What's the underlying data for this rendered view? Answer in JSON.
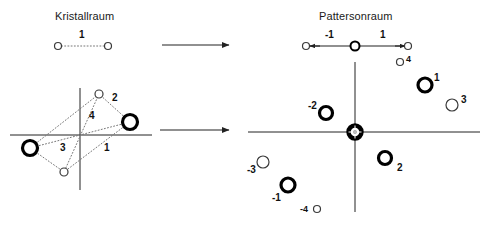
{
  "figure": {
    "background": "#ffffff",
    "stroke": "#222222",
    "dotted_stroke": "#777777"
  },
  "panels": {
    "left": {
      "title": "Kristallraum",
      "title_pos": {
        "x": 55,
        "y": 10
      },
      "dimer": {
        "atoms": [
          {
            "name": "atom-left",
            "cx": 58,
            "cy": 46,
            "r": 3.5,
            "weight": "light"
          },
          {
            "name": "atom-right",
            "cx": 108,
            "cy": 46,
            "r": 3.5,
            "weight": "light"
          }
        ],
        "vector_label": "1",
        "vector_label_pos": {
          "x": 79,
          "y": 29
        }
      },
      "structure": {
        "axes": {
          "x": {
            "x1": 10,
            "y1": 135,
            "x2": 152,
            "y2": 135
          },
          "y": {
            "x1": 80,
            "y1": 88,
            "x2": 80,
            "y2": 190
          }
        },
        "atoms": [
          {
            "name": "heavy-atom-left",
            "cx": 30,
            "cy": 148,
            "r": 7.5,
            "weight": "heavy"
          },
          {
            "name": "heavy-atom-right",
            "cx": 130,
            "cy": 122,
            "r": 7.5,
            "weight": "heavy"
          },
          {
            "name": "light-atom-top",
            "cx": 99,
            "cy": 94,
            "r": 4.0,
            "weight": "light"
          },
          {
            "name": "light-atom-bottom",
            "cx": 64,
            "cy": 172,
            "r": 4.0,
            "weight": "light"
          }
        ],
        "vector_labels": [
          {
            "text": "2",
            "x": 112,
            "y": 92
          },
          {
            "text": "4",
            "x": 89,
            "y": 110
          },
          {
            "text": "3",
            "x": 60,
            "y": 142
          },
          {
            "text": "1",
            "x": 104,
            "y": 142
          }
        ]
      }
    },
    "arrows": [
      {
        "name": "arrow-top",
        "x1": 162,
        "y1": 45,
        "x2": 229,
        "y2": 45
      },
      {
        "name": "arrow-bottom",
        "x1": 160,
        "y1": 130,
        "x2": 229,
        "y2": 130
      }
    ],
    "right": {
      "title": "Pattersonraum",
      "title_pos": {
        "x": 319,
        "y": 10
      },
      "patterson_1d": {
        "axis": {
          "x1": 306,
          "y1": 46,
          "x2": 409,
          "y2": 46
        },
        "peaks": [
          {
            "name": "peak-minus-1",
            "cx": 306,
            "cy": 46,
            "r": 3.5,
            "weight": "light"
          },
          {
            "name": "peak-origin",
            "cx": 355,
            "cy": 46,
            "r": 4.5,
            "weight": "medium"
          },
          {
            "name": "peak-plus-1",
            "cx": 408,
            "cy": 46,
            "r": 3.5,
            "weight": "light"
          }
        ],
        "labels": [
          {
            "text": "-1",
            "x": 325,
            "y": 29
          },
          {
            "text": "1",
            "x": 380,
            "y": 29
          }
        ]
      },
      "patterson_2d": {
        "axes": {
          "x": {
            "x1": 248,
            "y1": 132,
            "x2": 480,
            "y2": 132
          },
          "y": {
            "x1": 355,
            "y1": 62,
            "x2": 355,
            "y2": 212
          }
        },
        "origin_peak": {
          "name": "origin-peak",
          "cx": 355,
          "cy": 132,
          "r": 6.5
        },
        "peaks": [
          {
            "name": "peak-4",
            "label": "4",
            "cx": 400,
            "cy": 62,
            "r": 3.5,
            "weight": "light",
            "label_x": 406,
            "label_y": 54
          },
          {
            "name": "peak-1",
            "label": "1",
            "cx": 425,
            "cy": 85,
            "r": 7.0,
            "weight": "heavy",
            "label_x": 434,
            "label_y": 72
          },
          {
            "name": "peak-3",
            "label": "3",
            "cx": 452,
            "cy": 105,
            "r": 6.0,
            "weight": "light",
            "label_x": 461,
            "label_y": 94
          },
          {
            "name": "peak-minus-2",
            "label": "-2",
            "cx": 326,
            "cy": 113,
            "r": 6.5,
            "weight": "heavy",
            "label_x": 308,
            "label_y": 100
          },
          {
            "name": "peak-2",
            "label": "2",
            "cx": 385,
            "cy": 158,
            "r": 6.5,
            "weight": "heavy",
            "label_x": 397,
            "label_y": 162
          },
          {
            "name": "peak-minus-3",
            "label": "-3",
            "cx": 263,
            "cy": 162,
            "r": 6.0,
            "weight": "light",
            "label_x": 247,
            "label_y": 164
          },
          {
            "name": "peak-minus-1",
            "label": "-1",
            "cx": 288,
            "cy": 185,
            "r": 7.0,
            "weight": "heavy",
            "label_x": 272,
            "label_y": 192
          },
          {
            "name": "peak-minus-4",
            "label": "-4",
            "cx": 317,
            "cy": 209,
            "r": 3.5,
            "weight": "light",
            "label_x": 300,
            "label_y": 204
          }
        ]
      }
    }
  }
}
